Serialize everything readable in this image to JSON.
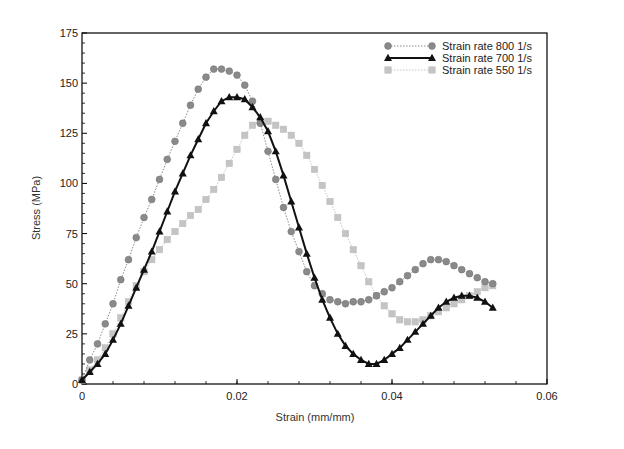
{
  "chart_data": {
    "type": "line",
    "title": "",
    "xlabel": "Strain (mm/mm)",
    "ylabel": "Stress (MPa)",
    "xlim": [
      0,
      0.06
    ],
    "ylim": [
      0,
      175
    ],
    "x_ticks": [
      "0",
      "0.02",
      "0.04",
      "0.06"
    ],
    "y_ticks": [
      "0",
      "25",
      "50",
      "75",
      "100",
      "125",
      "150",
      "175"
    ],
    "grid": false,
    "legend_position": "upper right",
    "series": [
      {
        "name": "Strain rate 800 1/s",
        "color": "#8a8a8a",
        "marker": "circle",
        "line": "dotted",
        "x": [
          0,
          0.001,
          0.002,
          0.003,
          0.004,
          0.005,
          0.006,
          0.007,
          0.008,
          0.009,
          0.01,
          0.011,
          0.012,
          0.013,
          0.014,
          0.015,
          0.016,
          0.017,
          0.018,
          0.019,
          0.02,
          0.021,
          0.022,
          0.023,
          0.024,
          0.025,
          0.026,
          0.027,
          0.028,
          0.029,
          0.03,
          0.031,
          0.032,
          0.033,
          0.034,
          0.035,
          0.036,
          0.037,
          0.038,
          0.039,
          0.04,
          0.041,
          0.042,
          0.043,
          0.044,
          0.045,
          0.046,
          0.047,
          0.048,
          0.049,
          0.05,
          0.051,
          0.052,
          0.053
        ],
        "y": [
          2,
          12,
          20,
          30,
          40,
          52,
          62,
          73,
          83,
          92,
          102,
          112,
          121,
          130,
          139,
          147,
          153,
          157,
          157,
          156,
          154,
          149,
          141,
          130,
          116,
          102,
          88,
          76,
          66,
          56,
          49,
          45,
          42,
          41,
          40,
          41,
          41,
          42,
          44,
          46,
          48,
          51,
          54,
          57,
          60,
          62,
          62,
          61,
          59,
          57,
          55,
          53,
          51,
          50
        ]
      },
      {
        "name": "Strain rate 700 1/s",
        "color": "#111111",
        "marker": "triangle",
        "line": "solid",
        "x": [
          0,
          0.001,
          0.002,
          0.003,
          0.004,
          0.005,
          0.006,
          0.007,
          0.008,
          0.009,
          0.01,
          0.011,
          0.012,
          0.013,
          0.014,
          0.015,
          0.016,
          0.017,
          0.018,
          0.019,
          0.02,
          0.021,
          0.022,
          0.023,
          0.024,
          0.025,
          0.026,
          0.027,
          0.028,
          0.029,
          0.03,
          0.031,
          0.032,
          0.033,
          0.034,
          0.035,
          0.036,
          0.037,
          0.038,
          0.039,
          0.04,
          0.041,
          0.042,
          0.043,
          0.044,
          0.045,
          0.046,
          0.047,
          0.048,
          0.049,
          0.05,
          0.051,
          0.052,
          0.053
        ],
        "y": [
          2,
          6,
          10,
          15,
          22,
          30,
          39,
          48,
          57,
          66,
          76,
          86,
          96,
          105,
          114,
          122,
          130,
          136,
          141,
          143,
          143,
          142,
          138,
          133,
          126,
          116,
          104,
          91,
          78,
          65,
          53,
          42,
          33,
          25,
          19,
          15,
          12,
          10,
          10,
          12,
          15,
          18,
          22,
          26,
          30,
          34,
          38,
          41,
          43,
          44,
          44,
          43,
          41,
          38
        ]
      },
      {
        "name": "Strain rate 550 1/s",
        "color": "#c4c4c4",
        "marker": "square",
        "line": "dotted",
        "x": [
          0,
          0.001,
          0.002,
          0.003,
          0.004,
          0.005,
          0.006,
          0.007,
          0.008,
          0.009,
          0.01,
          0.011,
          0.012,
          0.013,
          0.014,
          0.015,
          0.016,
          0.017,
          0.018,
          0.019,
          0.02,
          0.021,
          0.022,
          0.023,
          0.024,
          0.025,
          0.026,
          0.027,
          0.028,
          0.029,
          0.03,
          0.031,
          0.032,
          0.033,
          0.034,
          0.035,
          0.036,
          0.037,
          0.038,
          0.039,
          0.04,
          0.041,
          0.042,
          0.043,
          0.044,
          0.045,
          0.046,
          0.047,
          0.048,
          0.049,
          0.05,
          0.051,
          0.052,
          0.053
        ],
        "y": [
          2,
          7,
          12,
          18,
          25,
          33,
          41,
          49,
          56,
          62,
          67,
          72,
          76,
          80,
          84,
          87,
          92,
          97,
          103,
          110,
          117,
          124,
          129,
          131,
          131,
          129,
          127,
          124,
          120,
          114,
          107,
          99,
          91,
          83,
          75,
          67,
          59,
          51,
          44,
          39,
          35,
          32,
          31,
          31,
          32,
          34,
          36,
          38,
          40,
          42,
          44,
          46,
          48,
          49
        ]
      }
    ]
  }
}
